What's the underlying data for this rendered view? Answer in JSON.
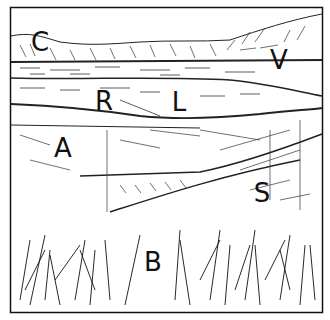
{
  "illustration": {
    "type": "landscape line drawing",
    "frame": {
      "x": 10,
      "y": 7,
      "width": 313,
      "height": 306,
      "stroke": "#111111"
    },
    "labels": [
      {
        "id": "C",
        "text": "C",
        "x": 40,
        "y": 42
      },
      {
        "id": "V",
        "text": "V",
        "x": 279,
        "y": 60
      },
      {
        "id": "R",
        "text": "R",
        "x": 104,
        "y": 101
      },
      {
        "id": "L",
        "text": "L",
        "x": 179,
        "y": 102
      },
      {
        "id": "A",
        "text": "A",
        "x": 63,
        "y": 148
      },
      {
        "id": "S",
        "text": "S",
        "x": 262,
        "y": 193
      },
      {
        "id": "B",
        "text": "B",
        "x": 153,
        "y": 262
      }
    ]
  }
}
